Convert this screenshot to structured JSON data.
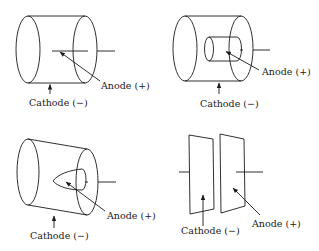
{
  "diagram": {
    "panels": [
      {
        "id": "coaxial-wire",
        "anode_label": "Anode (+)",
        "cathode_label": "Cathode (−)"
      },
      {
        "id": "coaxial-cylinder",
        "anode_label": "Anode (+)",
        "cathode_label": "Cathode (−)"
      },
      {
        "id": "coaxial-cone",
        "anode_label": "Anode (+)",
        "cathode_label": "Cathode (−)"
      },
      {
        "id": "parallel-plates",
        "anode_label": "Anode (+)",
        "cathode_label": "Cathode (−)"
      }
    ],
    "colors": {
      "stroke": "#1a1a1a",
      "background": "#ffffff"
    }
  }
}
